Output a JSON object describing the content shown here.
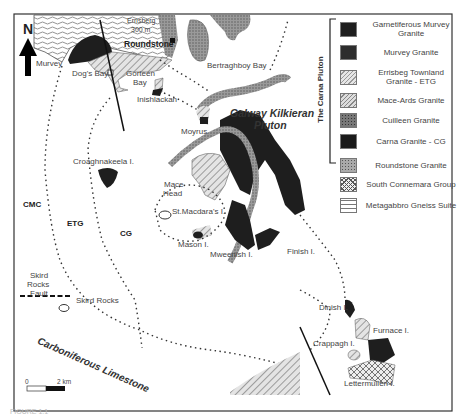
{
  "figure": {
    "caption_fragment": "FIGURE 1.1",
    "north_label": "N",
    "scale_bar": {
      "start": "0",
      "end": "2 km"
    }
  },
  "map_labels": {
    "errisberg": "Errisberg",
    "errisberg_height": "300 m",
    "roundstone": "Roundstone",
    "murvey": "Murvey",
    "dogs_bay": "Dog's Bay",
    "gorteen_bay_1": "Gorteen",
    "gorteen_bay_2": "Bay",
    "inishlackan": "Inishlackan",
    "bertraghboy_bay": "Bertraghboy Bay",
    "galway_pluton_1": "Galway Kilkieran",
    "galway_pluton_2": "Pluton",
    "moyrus": "Moyrus",
    "croaghnakeela": "Croaghnakeela I.",
    "mace_head_1": "Mace",
    "mace_head_2": "Head",
    "st_macdaras": "St.Macdara's I.",
    "mason": "Mason I.",
    "mweenish": "Mweenish I.",
    "finish": "Finish I.",
    "cmc": "CMC",
    "etg": "ETG",
    "cg": "CG",
    "skird_fault_1": "Skird",
    "skird_fault_2": "Rocks",
    "skird_fault_3": "Fault",
    "skird_rocks": "Skird Rocks",
    "carboniferous": "Carboniferous Limestone",
    "dinish": "Dinish I.",
    "furnace": "Furnace I.",
    "crappagh": "Crappagh I.",
    "lettermullen": "Lettermullen I."
  },
  "legend": {
    "group_title": "The Carna Pluton",
    "items": [
      {
        "label": "Garnetiferous Murvey Granite",
        "pattern": "solid-dark"
      },
      {
        "label": "Murvey Granite",
        "pattern": "dark-stipple"
      },
      {
        "label": "Errisbeg Townland Granite - ETG",
        "pattern": "hatch-light"
      },
      {
        "label": "Mace-Ards Granite",
        "pattern": "hatch"
      },
      {
        "label": "Cuilleen Granite",
        "pattern": "grey-stipple"
      },
      {
        "label": "Carna Granite - CG",
        "pattern": "solid-dark"
      },
      {
        "label": "Roundstone Granite",
        "pattern": "light-stipple"
      },
      {
        "label": "South Connemara Group",
        "pattern": "crosshatch"
      },
      {
        "label": "Metagabbro Gneiss Suite",
        "pattern": "wavy"
      }
    ]
  },
  "colors": {
    "dark": "#1e1e1e",
    "grey": "#8a8a8a",
    "hatch": "#9a9a9a",
    "frame": "#333333"
  }
}
